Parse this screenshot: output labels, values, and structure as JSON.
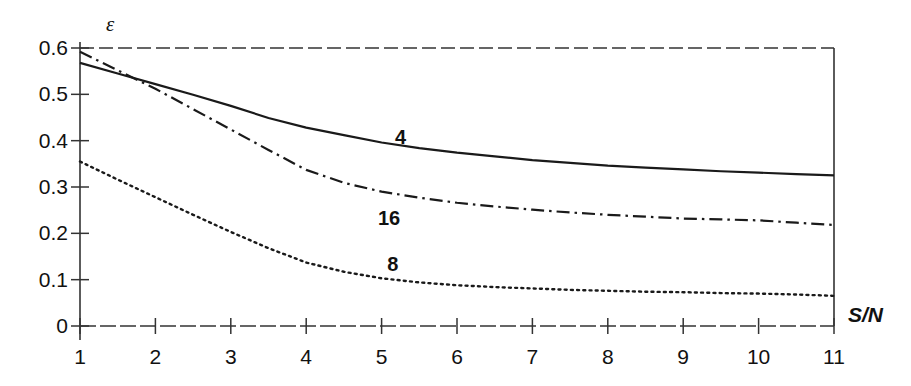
{
  "chart_data": {
    "type": "line",
    "title": "",
    "subtitle": "",
    "xlabel": "S/N",
    "ylabel": "ε",
    "xlim": [
      1,
      11
    ],
    "ylim": [
      0,
      0.6
    ],
    "grid": false,
    "legend_position": "inline-annotations",
    "x_ticks": [
      "1",
      "2",
      "3",
      "4",
      "5",
      "6",
      "7",
      "8",
      "9",
      "10",
      "11"
    ],
    "y_ticks": [
      "0",
      "0.1",
      "0.2",
      "0.3",
      "0.4",
      "0.5",
      "0.6"
    ],
    "x_tick_values": [
      1,
      2,
      3,
      4,
      5,
      6,
      7,
      8,
      9,
      10,
      11
    ],
    "y_tick_values": [
      0,
      0.1,
      0.2,
      0.3,
      0.4,
      0.5,
      0.6
    ],
    "x": [
      1,
      1.5,
      2,
      2.5,
      3,
      3.5,
      4,
      4.5,
      5,
      5.5,
      6,
      6.5,
      7,
      7.5,
      8,
      8.5,
      9,
      9.5,
      10,
      10.5,
      11
    ],
    "series": [
      {
        "name": "4",
        "style": "solid",
        "color": "#1a1a1a",
        "label_x": 5.25,
        "label_y": 0.405,
        "values": [
          0.568,
          0.545,
          0.522,
          0.499,
          0.475,
          0.449,
          0.428,
          0.412,
          0.396,
          0.384,
          0.374,
          0.366,
          0.358,
          0.352,
          0.346,
          0.342,
          0.338,
          0.334,
          0.331,
          0.328,
          0.325
        ]
      },
      {
        "name": "16",
        "style": "dashdot",
        "color": "#1a1a1a",
        "label_x": 5.1,
        "label_y": 0.232,
        "values": [
          0.592,
          0.552,
          0.512,
          0.468,
          0.424,
          0.38,
          0.337,
          0.309,
          0.29,
          0.277,
          0.266,
          0.258,
          0.251,
          0.245,
          0.24,
          0.236,
          0.232,
          0.23,
          0.228,
          0.223,
          0.218
        ]
      },
      {
        "name": "8",
        "style": "dotted",
        "color": "#1a1a1a",
        "label_x": 5.15,
        "label_y": 0.131,
        "values": [
          0.355,
          0.316,
          0.278,
          0.24,
          0.203,
          0.168,
          0.137,
          0.117,
          0.103,
          0.094,
          0.088,
          0.084,
          0.081,
          0.078,
          0.076,
          0.074,
          0.073,
          0.071,
          0.07,
          0.068,
          0.065
        ]
      }
    ],
    "annotations": []
  }
}
